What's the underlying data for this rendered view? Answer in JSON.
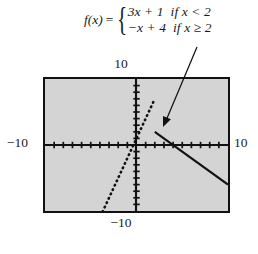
{
  "figure": {
    "type": "graph"
  },
  "formula": {
    "function_name": "f(x)",
    "equals": "=",
    "brace": "{",
    "cases": [
      {
        "expression": "3x + 1",
        "condition": "if x < 2"
      },
      {
        "expression": "−x + 4",
        "condition": "if x ≥ 2"
      }
    ]
  },
  "axes": {
    "top_label": "10",
    "bottom_label": "−10",
    "left_label": "−10",
    "right_label": "10",
    "xmin": -10,
    "xmax": 10,
    "ymin": -10,
    "ymax": 10,
    "tick_step": 1
  },
  "chart_data": {
    "type": "line",
    "title": "",
    "xlabel": "",
    "ylabel": "",
    "xlim": [
      -10,
      10
    ],
    "ylim": [
      -10,
      10
    ],
    "grid": false,
    "legend": "none",
    "series": [
      {
        "name": "3x + 1 if x < 2",
        "style": "dotted",
        "color": "#111111",
        "domain": [
          -3.7,
          2
        ],
        "points": [
          {
            "x": -3.7,
            "y": -10.1
          },
          {
            "x": 2,
            "y": 7
          }
        ]
      },
      {
        "name": "−x + 4 if x ≥ 2",
        "style": "solid",
        "color": "#111111",
        "domain": [
          2,
          10
        ],
        "points": [
          {
            "x": 2,
            "y": 2
          },
          {
            "x": 10,
            "y": -6
          }
        ]
      }
    ],
    "annotations": [
      {
        "type": "arrow",
        "label": "",
        "points_to": {
          "x": 2,
          "y": 2
        },
        "from_pixel": {
          "x": 197,
          "y": 47
        },
        "to_pixel": {
          "x": 163,
          "y": 127
        }
      }
    ]
  },
  "colors": {
    "plot_background": "#d4d4d4",
    "frame": "#111111",
    "curve": "#111111",
    "page_background": "#ffffff"
  },
  "icons": {
    "pointer": "arrow-icon"
  }
}
